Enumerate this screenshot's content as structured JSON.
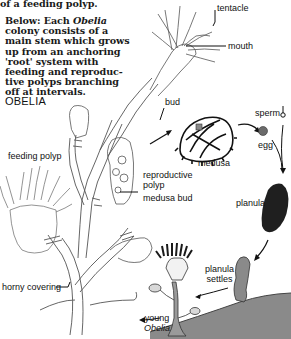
{
  "caption_top": "of a feeding polyp.",
  "caption_main": {
    "lines": [
      "Below: Each ",
      "Obelia",
      "colony consists of a",
      "main stem which grows",
      "up from an anchoring",
      "'root' system with",
      "feeding and reproduc-",
      "tive polyps branching",
      "off at intervals."
    ]
  },
  "title": "OBELIA",
  "labels": {
    "tentacle": "tentacle",
    "mouth": "mouth",
    "bud": "bud",
    "feeding_polyp": "feeding polyp",
    "sperm": "sperm",
    "egg": "egg",
    "medusa": "medusa",
    "reproductive_polyp_1": "reproductive",
    "reproductive_polyp_2": "polyp",
    "medusa_bud": "medusa bud",
    "planula": "planula",
    "planula_settles_1": "planula",
    "planula_settles_2": "settles",
    "horny_covering": "horny covering",
    "young_obelia_1": "young",
    "young_obelia_2": "Obelia"
  },
  "colors": {
    "ink": "#1a1a1a",
    "line": "#555555",
    "ground": "#7a7a7a",
    "planula": "#222222",
    "egg": "#6b6b6b"
  }
}
